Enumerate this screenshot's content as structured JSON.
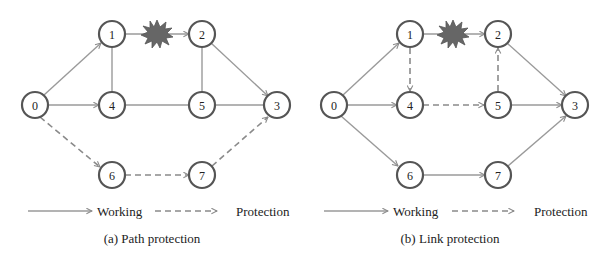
{
  "colors": {
    "working_line": "#9a9a9a",
    "protection_line": "#8a8a8a",
    "node_border": "#555555",
    "failure_burst": "#666666"
  },
  "panels": [
    {
      "id": "a",
      "caption": "(a) Path protection",
      "nodes": [
        {
          "id": "0",
          "label": "0"
        },
        {
          "id": "1",
          "label": "1"
        },
        {
          "id": "2",
          "label": "2"
        },
        {
          "id": "3",
          "label": "3"
        },
        {
          "id": "4",
          "label": "4"
        },
        {
          "id": "5",
          "label": "5"
        },
        {
          "id": "6",
          "label": "6"
        },
        {
          "id": "7",
          "label": "7"
        }
      ],
      "working_path": [
        "0",
        "1",
        "2",
        "3"
      ],
      "protection_path": [
        "0",
        "6",
        "7",
        "3"
      ],
      "plain_links": [
        [
          "1",
          "4"
        ],
        [
          "0",
          "4"
        ],
        [
          "4",
          "5"
        ],
        [
          "5",
          "3"
        ],
        [
          "2",
          "5"
        ]
      ],
      "failed_link": [
        "1",
        "2"
      ],
      "legend": {
        "working": "Working",
        "protection": "Protection"
      }
    },
    {
      "id": "b",
      "caption": "(b) Link protection",
      "nodes": [
        {
          "id": "0",
          "label": "0"
        },
        {
          "id": "1",
          "label": "1"
        },
        {
          "id": "2",
          "label": "2"
        },
        {
          "id": "3",
          "label": "3"
        },
        {
          "id": "4",
          "label": "4"
        },
        {
          "id": "5",
          "label": "5"
        },
        {
          "id": "6",
          "label": "6"
        },
        {
          "id": "7",
          "label": "7"
        }
      ],
      "working_path": [
        "0",
        "1",
        "2",
        "3"
      ],
      "protection_path": [
        "1",
        "4",
        "5",
        "2"
      ],
      "plain_links": [
        [
          "0",
          "4"
        ],
        [
          "5",
          "3"
        ],
        [
          "0",
          "6"
        ],
        [
          "6",
          "7"
        ],
        [
          "7",
          "3"
        ]
      ],
      "failed_link": [
        "1",
        "2"
      ],
      "legend": {
        "working": "Working",
        "protection": "Protection"
      }
    }
  ]
}
